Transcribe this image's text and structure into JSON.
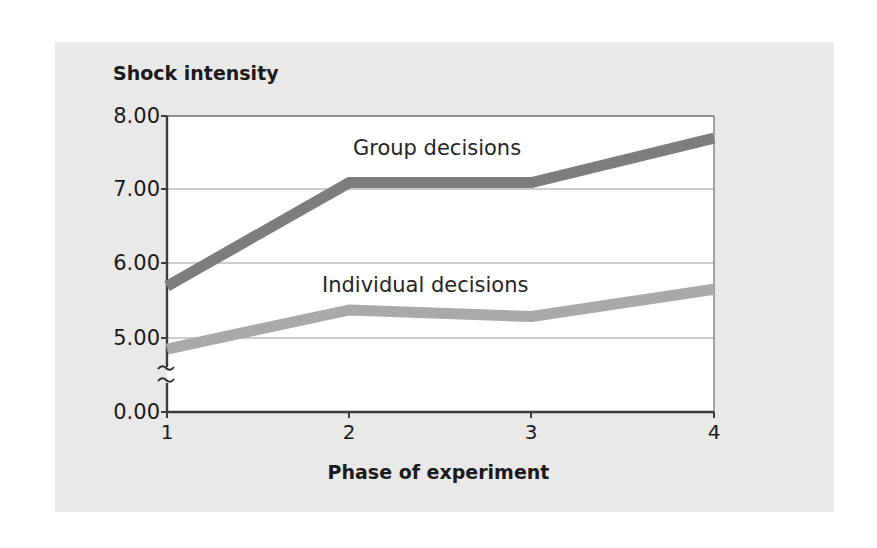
{
  "chart_data": {
    "type": "line",
    "title": "",
    "xlabel": "Phase of experiment",
    "ylabel": "Shock intensity",
    "categories": [
      "1",
      "2",
      "3",
      "4"
    ],
    "x": [
      1,
      2,
      3,
      4
    ],
    "xlim": [
      1,
      4
    ],
    "ylim": [
      0.0,
      8.0
    ],
    "y_ticks": [
      "0.00",
      "5.00",
      "6.00",
      "7.00",
      "8.00"
    ],
    "y_tick_values": [
      0.0,
      5.0,
      6.0,
      7.0,
      8.0
    ],
    "x_ticks": [
      "1",
      "2",
      "3",
      "4"
    ],
    "axis_break": true,
    "axis_break_note": "broken y-axis between 0.00 and 5.00",
    "grid": "horizontal",
    "legend_position": "inline-labels",
    "series": [
      {
        "name": "Group decisions",
        "values": [
          5.7,
          7.1,
          7.1,
          7.7
        ],
        "color": "#7d7d7d",
        "label_x": 2.05,
        "label_y": 7.55
      },
      {
        "name": "Individual decisions",
        "values": [
          4.85,
          5.38,
          5.29,
          5.66
        ],
        "color": "#a9a9a9",
        "label_x": 1.85,
        "label_y": 5.92
      }
    ]
  },
  "axes": {
    "y_title": "Shock intensity",
    "x_title": "Phase of experiment",
    "y_labels": [
      "8.00",
      "7.00",
      "6.00",
      "5.00",
      "0.00"
    ],
    "x_labels": [
      "1",
      "2",
      "3",
      "4"
    ]
  },
  "labels": {
    "group": "Group decisions",
    "individual": "Individual decisions"
  },
  "colors": {
    "panel_background": "#e9e9e9",
    "plot_background": "#ffffff",
    "axis": "#3a3a3a",
    "grid": "#9a9a9a",
    "series_group": "#7d7d7d",
    "series_individual": "#a9a9a9",
    "text": "#1a1a1a"
  }
}
